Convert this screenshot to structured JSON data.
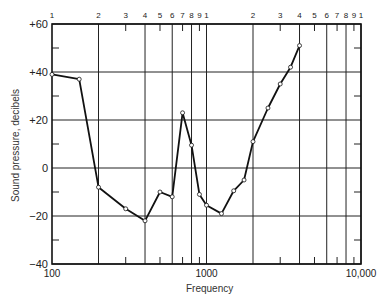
{
  "chart_data": {
    "type": "line",
    "title": "",
    "xlabel": "Frequency",
    "ylabel": "Sound pressure, decibels",
    "xscale": "log",
    "xlim": [
      100,
      10000
    ],
    "ylim": [
      -40,
      60
    ],
    "grid": true,
    "x_tick_labels_bottom": [
      "100",
      "1000",
      "10,000"
    ],
    "x_tick_labels_top": [
      "1",
      "2",
      "3",
      "4",
      "5",
      "6",
      "7",
      "8",
      "9",
      "1",
      "2",
      "3",
      "4",
      "5",
      "6",
      "7",
      "8",
      "9",
      "1"
    ],
    "y_tick_labels": [
      "+60",
      "+40",
      "+20",
      "0",
      "−20",
      "−40"
    ],
    "y_ticks": [
      60,
      40,
      20,
      0,
      -20,
      -40
    ],
    "series": [
      {
        "name": "Sound pressure",
        "x": [
          100,
          150,
          200,
          300,
          400,
          500,
          600,
          700,
          800,
          900,
          1000,
          1250,
          1500,
          1750,
          2000,
          2500,
          3000,
          3500,
          4000
        ],
        "values": [
          39,
          37,
          -8,
          -17,
          -22,
          -10,
          -12,
          23,
          9.5,
          -11,
          -15.5,
          -19,
          -9.5,
          -5,
          11,
          25,
          35,
          42,
          51
        ]
      }
    ]
  }
}
